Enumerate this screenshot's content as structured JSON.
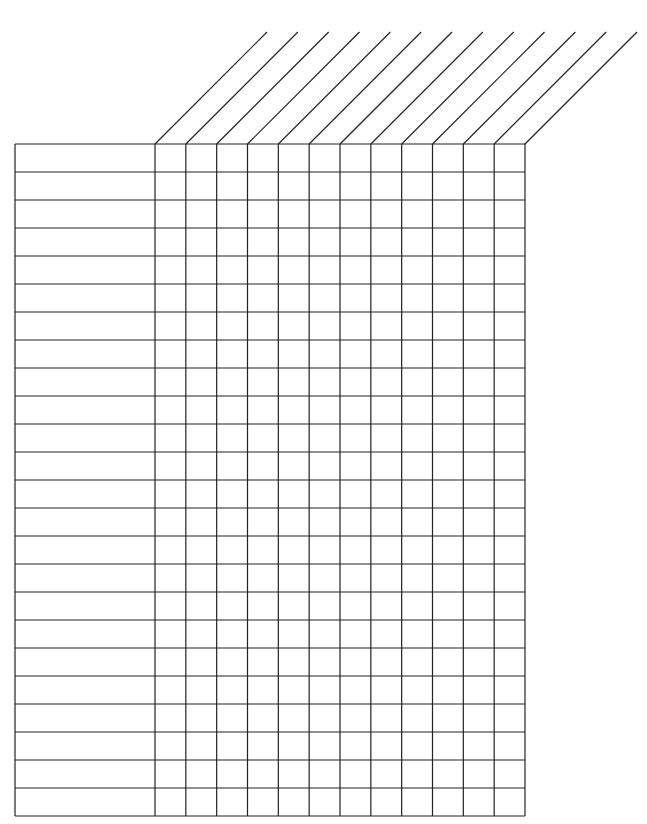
{
  "template": {
    "type": "blank-checklist-grid",
    "row_count": 24,
    "label_column_count": 1,
    "check_column_count": 12,
    "slanted_header_count": 12,
    "line_color": "#222222",
    "background_color": "#ffffff",
    "row_labels": [
      "",
      "",
      "",
      "",
      "",
      "",
      "",
      "",
      "",
      "",
      "",
      "",
      "",
      "",
      "",
      "",
      "",
      "",
      "",
      "",
      "",
      "",
      "",
      ""
    ],
    "column_headers": [
      "",
      "",
      "",
      "",
      "",
      "",
      "",
      "",
      "",
      "",
      "",
      ""
    ]
  }
}
